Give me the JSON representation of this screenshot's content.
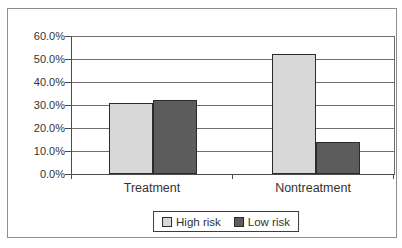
{
  "chart_data": {
    "type": "bar",
    "title": "",
    "xlabel": "",
    "ylabel": "",
    "categories": [
      "Treatment",
      "Nontreatment"
    ],
    "series": [
      {
        "name": "High risk",
        "values": [
          31,
          52
        ],
        "color": "#d8d8d8"
      },
      {
        "name": "Low risk",
        "values": [
          32,
          14
        ],
        "color": "#5c5c5c"
      }
    ],
    "ylim": [
      0,
      60
    ],
    "ytick_interval": 10,
    "ytick_labels": [
      "60.0%",
      "50.0%",
      "40.0%",
      "30.0%",
      "20.0%",
      "10.0%",
      "0.0%"
    ],
    "value_format": "percent_one_decimal",
    "grid": true,
    "legend_position": "bottom-center",
    "colors": {
      "high_risk_fill": "#d8d8d8",
      "low_risk_fill": "#5c5c5c",
      "bar_border": "#2b2b2b",
      "gridline": "#6e6e6e",
      "axis": "#4c4c4c",
      "frame_border": "#8d8d8d",
      "background": "#ffffff",
      "text": "#333333"
    }
  }
}
